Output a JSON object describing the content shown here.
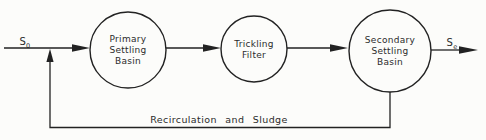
{
  "diagram": {
    "type": "process-flow",
    "influent_label": {
      "base": "S",
      "subscript": "0"
    },
    "effluent_label": {
      "base": "S",
      "subscript": "e"
    },
    "nodes": [
      {
        "id": "primary-settling-basin",
        "label_lines": [
          "Primary",
          "Settling",
          "Basin"
        ]
      },
      {
        "id": "trickling-filter",
        "label_lines": [
          "Trickling",
          "Filter"
        ]
      },
      {
        "id": "secondary-settling-basin",
        "label_lines": [
          "Secondary",
          "Settling",
          "Basin"
        ]
      }
    ],
    "recirculation_label": "Recirculation and Sludge",
    "colors": {
      "line": "#222222",
      "text": "#2b2b2b",
      "background": "#fcfcfa"
    }
  }
}
